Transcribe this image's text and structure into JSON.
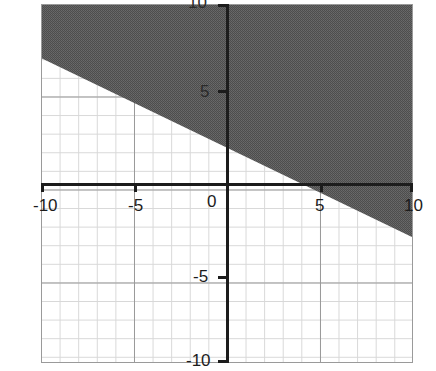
{
  "graph": {
    "title": "",
    "background_color": "#ffffff",
    "axis_color": "#1c1c1c",
    "grid_minor_color": "#d8d8d8",
    "grid_major_color": "#9a9a9a",
    "shade_color": "#565656",
    "x_tick_labels": [
      {
        "value": -10,
        "text": "-10"
      },
      {
        "value": -5,
        "text": "-5"
      },
      {
        "value": 0,
        "text": "0"
      },
      {
        "value": 5,
        "text": "5"
      },
      {
        "value": 10,
        "text": "10"
      }
    ],
    "y_tick_labels": [
      {
        "value": 10,
        "text": "10"
      },
      {
        "value": 5,
        "text": "5"
      },
      {
        "value": -5,
        "text": "-5"
      },
      {
        "value": -10,
        "text": "-10"
      }
    ]
  },
  "chart_data": {
    "type": "line",
    "title": "",
    "xlabel": "",
    "ylabel": "",
    "xlim": [
      -10,
      10
    ],
    "ylim": [
      -10,
      10
    ],
    "grid": true,
    "grid_minor_step": 1,
    "grid_major_step": 5,
    "legend": "none",
    "xticks": [
      -10,
      -5,
      0,
      5,
      10
    ],
    "yticks": [
      -10,
      -5,
      0,
      5,
      10
    ],
    "series": [
      {
        "name": "boundary-line",
        "equation": "y = -0.5x + 2",
        "slope": -0.5,
        "intercept": 2,
        "x_intercept": 4,
        "line_style": "solid",
        "x": [
          -10,
          10
        ],
        "values": [
          7,
          -3
        ]
      }
    ],
    "annotations": [
      {
        "name": "shaded-region",
        "description": "Half-plane above and including the line y = -0.5x + 2 is shaded dark gray",
        "inequality": "y >= -0.5x + 2",
        "fill": "#565656"
      }
    ]
  }
}
